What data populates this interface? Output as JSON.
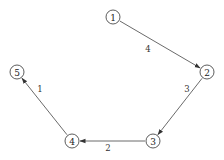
{
  "diagram": {
    "type": "directed-graph",
    "nodes": [
      {
        "id": "1",
        "label": "1"
      },
      {
        "id": "2",
        "label": "2"
      },
      {
        "id": "3",
        "label": "3"
      },
      {
        "id": "4",
        "label": "4"
      },
      {
        "id": "5",
        "label": "5"
      }
    ],
    "edges": [
      {
        "from": "1",
        "to": "2",
        "label": "4"
      },
      {
        "from": "2",
        "to": "3",
        "label": "3"
      },
      {
        "from": "3",
        "to": "4",
        "label": "2"
      },
      {
        "from": "4",
        "to": "5",
        "label": "1"
      }
    ]
  }
}
